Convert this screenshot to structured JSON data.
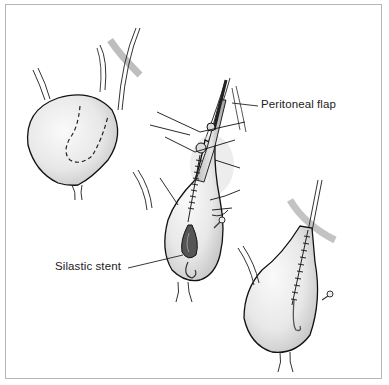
{
  "figure": {
    "panels": [
      {
        "id": "bladder-before",
        "description": "Bladder with dashed incision outline"
      },
      {
        "id": "bladder-flap-tubularized",
        "description": "Bladder flap tubularized with sutures and stent"
      },
      {
        "id": "bladder-after",
        "description": "Completed repair with suture line"
      }
    ],
    "labels": {
      "peritoneal_flap": "Peritoneal flap",
      "silastic_stent": "Silastic stent"
    },
    "colors": {
      "border": "#b5b5b5",
      "outline": "#1a1a1a",
      "fill_light": "#f2f2f2",
      "fill_shade": "#c8c8c8",
      "text": "#222222"
    }
  }
}
